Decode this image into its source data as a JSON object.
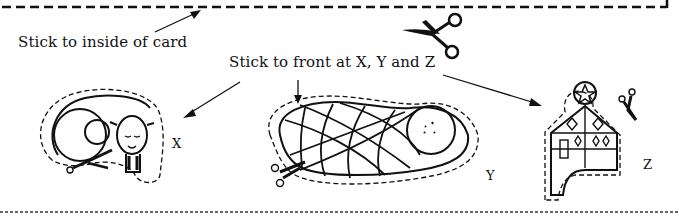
{
  "labels": {
    "inside_card": "Stick to inside of card",
    "front": "Stick to front at X, Y and Z"
  },
  "markers": {
    "x": "X",
    "y": "Y",
    "z": "Z"
  },
  "cutouts": [
    {
      "id": "X",
      "name": "sheep",
      "icon": "sheep-icon"
    },
    {
      "id": "Y",
      "name": "baby in swaddle",
      "icon": "baby-icon"
    },
    {
      "id": "Z",
      "name": "house with star",
      "icon": "house-icon"
    }
  ],
  "colors": {
    "ink": "#111111",
    "background": "#ffffff"
  }
}
